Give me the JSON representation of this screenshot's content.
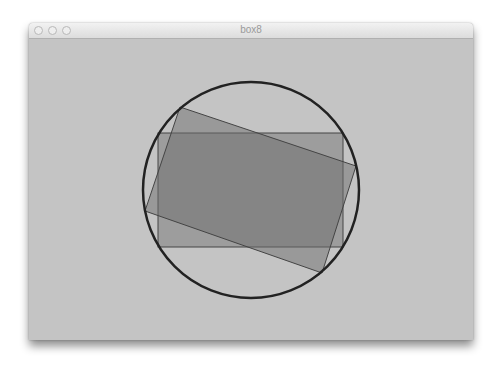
{
  "window": {
    "title": "box8",
    "buttons": [
      {
        "name": "close-button"
      },
      {
        "name": "minimize-button"
      },
      {
        "name": "zoom-button"
      }
    ]
  },
  "canvas": {
    "background": "#c4c4c4",
    "circle": {
      "cx": 222,
      "cy": 151,
      "r": 108,
      "stroke": "#222222",
      "stroke_width": 2.5
    },
    "axis_rect": {
      "x": 129,
      "y": 94,
      "w": 185,
      "h": 114,
      "fill": "#6e6e6e",
      "opacity": 0.45,
      "stroke": "#444444"
    },
    "rotated_rect": {
      "points": "151,68 327,127 293,234 116,172",
      "fill": "#6e6e6e",
      "opacity": 0.5,
      "stroke": "#444444"
    }
  }
}
